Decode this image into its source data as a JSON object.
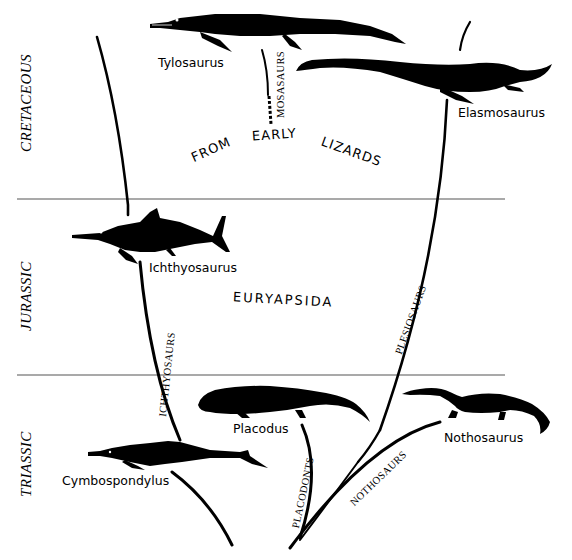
{
  "periods": [
    {
      "label": "CRETACEOUS"
    },
    {
      "label": "JURASSIC"
    },
    {
      "label": "TRIASSIC"
    }
  ],
  "central_label": {
    "top_words": [
      "FROM",
      "EARLY",
      "LIZARDS"
    ],
    "group": "EURYAPSIDA"
  },
  "lineages": [
    {
      "label": "MOSASAURS"
    },
    {
      "label": "ICHTHYOSAURS"
    },
    {
      "label": "PLESIOSAURS"
    },
    {
      "label": "PLACODONTS"
    },
    {
      "label": "NOTHOSAURS"
    }
  ],
  "animals": [
    {
      "name": "Tylosaurus"
    },
    {
      "name": "Elasmosaurus"
    },
    {
      "name": "Ichthyosaurus"
    },
    {
      "name": "Placodus"
    },
    {
      "name": "Nothosaurus"
    },
    {
      "name": "Cymbospondylus"
    }
  ],
  "colors": {
    "ink": "#000000",
    "rule": "#555555",
    "paper": "#ffffff"
  }
}
